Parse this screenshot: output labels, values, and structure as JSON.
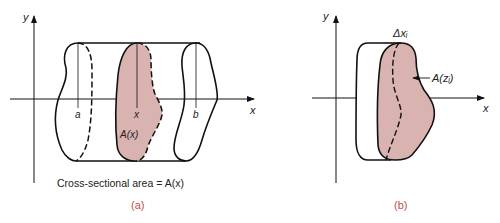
{
  "panel_a": {
    "y_axis_label": "y",
    "x_axis_label": "x",
    "label_a": "a",
    "label_x": "x",
    "label_b": "b",
    "area_label": "A(x)",
    "caption": "Cross-sectional area = A(x)",
    "panel_label": "(a)"
  },
  "panel_b": {
    "y_axis_label": "y",
    "x_axis_label": "x",
    "delta_label": "Δxᵢ",
    "area_label": "A(zᵢ)",
    "panel_label": "(b)"
  },
  "colors": {
    "fill": "#d9b3b0",
    "stroke": "#111111",
    "panel_label": "#c0504d"
  }
}
